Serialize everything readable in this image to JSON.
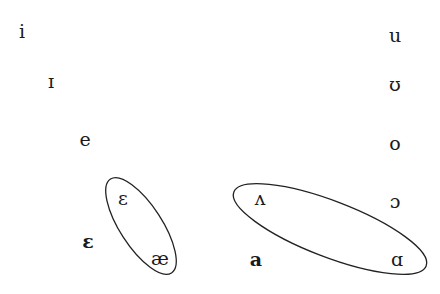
{
  "diagram": {
    "type": "vowel-chart",
    "vowels": [
      {
        "id": "i",
        "symbol": "i",
        "x": 22,
        "y": 31,
        "bold": false
      },
      {
        "id": "near-close-front",
        "symbol": "ɪ",
        "x": 51,
        "y": 81,
        "bold": false
      },
      {
        "id": "e",
        "symbol": "e",
        "x": 85,
        "y": 139,
        "bold": false
      },
      {
        "id": "open-mid-front-bold",
        "symbol": "ɛ",
        "x": 88,
        "y": 241,
        "bold": true
      },
      {
        "id": "open-mid-front-circled",
        "symbol": "ɛ",
        "x": 123,
        "y": 198,
        "bold": false
      },
      {
        "id": "ae",
        "symbol": "æ",
        "x": 160,
        "y": 258,
        "bold": false
      },
      {
        "id": "wedge",
        "symbol": "ʌ",
        "x": 260,
        "y": 198,
        "bold": false
      },
      {
        "id": "a",
        "symbol": "a",
        "x": 256,
        "y": 259,
        "bold": true
      },
      {
        "id": "u",
        "symbol": "u",
        "x": 395,
        "y": 35,
        "bold": false
      },
      {
        "id": "upsilon",
        "symbol": "ʊ",
        "x": 395,
        "y": 84,
        "bold": false
      },
      {
        "id": "o",
        "symbol": "o",
        "x": 395,
        "y": 143,
        "bold": false
      },
      {
        "id": "open-o",
        "symbol": "ɔ",
        "x": 395,
        "y": 201,
        "bold": false
      },
      {
        "id": "script-a",
        "symbol": "ɑ",
        "x": 397,
        "y": 259,
        "bold": false
      }
    ],
    "groupings": [
      {
        "id": "front-group",
        "members": [
          "ɛ",
          "æ"
        ],
        "cx": 141,
        "cy": 226,
        "rx": 56,
        "ry": 21,
        "rotate": 57
      },
      {
        "id": "back-group",
        "members": [
          "ʌ",
          "ɑ"
        ],
        "cx": 330,
        "cy": 229,
        "rx": 103,
        "ry": 28,
        "rotate": 21
      }
    ],
    "colors": {
      "text": "#1a1a1a",
      "outline": "#222222",
      "background": "#ffffff"
    }
  }
}
